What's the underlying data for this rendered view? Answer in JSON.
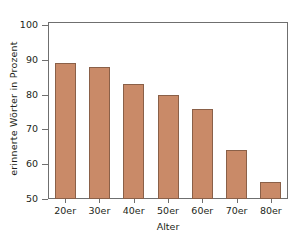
{
  "chart_data": {
    "type": "bar",
    "title": "",
    "xlabel": "Alter",
    "ylabel": "erinnerte Wörter in Prozent",
    "categories": [
      "20er",
      "30er",
      "40er",
      "50er",
      "60er",
      "70er",
      "80er"
    ],
    "values": [
      89,
      88,
      83,
      80,
      76,
      64,
      55
    ],
    "ylim": [
      50,
      100
    ],
    "yticks": [
      50,
      60,
      70,
      80,
      90,
      100
    ],
    "ytick_labels": [
      "50",
      "60",
      "70",
      "80",
      "90",
      "100"
    ],
    "grid": false,
    "legend": null,
    "bar_color": "#c98a68",
    "bar_edge_color": "#8a6048",
    "axis_color": "#6f6f6f",
    "text_color": "#231f20",
    "background": "#ffffff"
  }
}
